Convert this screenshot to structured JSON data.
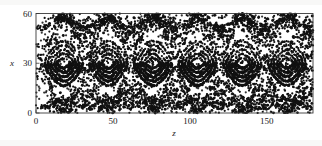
{
  "figure": {
    "background_color": "#ffffff",
    "ink_color": "#111111",
    "frame_color": "#3a3a3a"
  },
  "chart_data": {
    "type": "scatter",
    "title": "",
    "subtitle": "",
    "xlabel": "z",
    "ylabel": "x",
    "xlim": [
      0,
      180
    ],
    "ylim": [
      0,
      60
    ],
    "xticks": [
      0,
      50,
      100,
      150
    ],
    "xticklabels": [
      "0",
      "50",
      "100",
      "150"
    ],
    "yticks": [
      0,
      30,
      60
    ],
    "yticklabels": [
      "0",
      "30",
      "60"
    ],
    "grid": false,
    "legend": null,
    "marker": "dot",
    "marker_size": 1.1,
    "structure": {
      "period_z": 29.0,
      "chain_centers_z": [
        18,
        47,
        76,
        105,
        134,
        163
      ],
      "x_point_offset_z": 14.5,
      "island_center_x": 30,
      "island_half_width_x": 14,
      "upper_boundary_x": 60,
      "lower_boundary_x": 0,
      "n_points_approx": 2600
    },
    "series": [
      {
        "name": "nested-island-arcs",
        "n_arcs_per_chain": 5,
        "arc_amplitudes_x": [
          3.0,
          5.6,
          8.2,
          10.8,
          13.4
        ]
      },
      {
        "name": "separatrix-web",
        "description": "upper and lower wavy separatrix branches crossing at X-points"
      },
      {
        "name": "stochastic-sea",
        "description": "diffuse scattered points filling the chaotic region near boundaries and X-points"
      }
    ]
  },
  "axes": {
    "x_axis_name": "z-axis",
    "y_axis_name": "x-axis"
  }
}
